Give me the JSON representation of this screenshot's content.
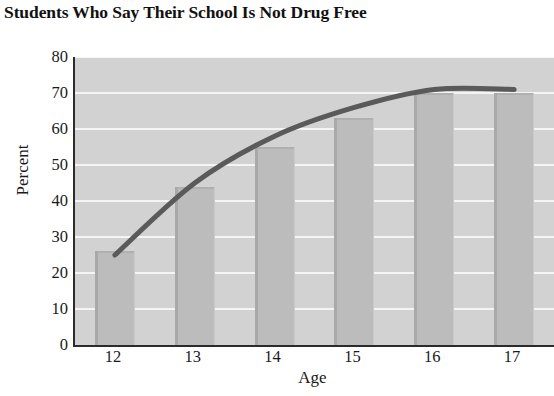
{
  "chart_data": {
    "type": "bar",
    "title": "Students Who Say Their School Is Not Drug Free",
    "xlabel": "Age",
    "ylabel": "Percent",
    "categories": [
      "12",
      "13",
      "14",
      "15",
      "16",
      "17"
    ],
    "values": [
      26,
      44,
      55,
      63,
      70,
      70
    ],
    "ylim": [
      0,
      80
    ],
    "ytick_labels": [
      "0",
      "10",
      "20",
      "30",
      "40",
      "50",
      "60",
      "70",
      "80"
    ],
    "ytick_values": [
      0,
      10,
      20,
      30,
      40,
      50,
      60,
      70,
      80
    ],
    "grid": true,
    "legend": "none",
    "series": [
      {
        "name": "Percent of students",
        "type": "bar",
        "values": [
          26,
          44,
          55,
          63,
          70,
          70
        ]
      },
      {
        "name": "Trend curve",
        "type": "line",
        "x": [
          "12",
          "13",
          "14",
          "15",
          "16",
          "17"
        ],
        "values": [
          25,
          45,
          58,
          66,
          71,
          71
        ]
      }
    ],
    "colors": {
      "plot_background": "#d2d2d2",
      "bar_fill": "#bcbcbc",
      "bar_edge": "#a9a9a9",
      "gridline": "#f4f4f4",
      "axis": "#2b2b2b",
      "trend_line": "#5a5a5a",
      "text": "#1a1a1a",
      "page_background": "#ffffff"
    }
  }
}
